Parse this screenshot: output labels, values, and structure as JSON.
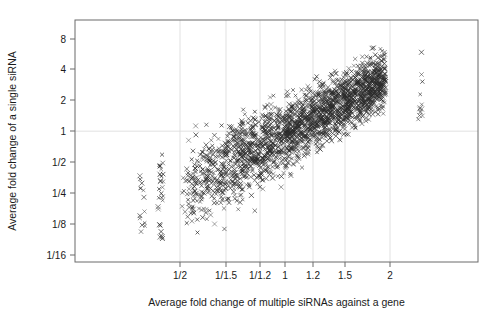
{
  "chart_data": {
    "type": "scatter",
    "title": "",
    "xlabel": "Average fold change of multiple siRNAs against a gene",
    "ylabel": "Average fold change of a single siRNA",
    "marker": "x-cross",
    "grid": "vertical gridlines at x ticks, horizontal gridline at y = 1",
    "legend": "none",
    "x_axis": {
      "scale": "log",
      "tick_labels": [
        "1/2",
        "1/1.5",
        "1/1.2",
        "1",
        "1.2",
        "1.5",
        "2"
      ],
      "tick_values": [
        0.5,
        0.6667,
        0.8333,
        1.0,
        1.2,
        1.5,
        2.0
      ],
      "tick_pixels": [
        180,
        226,
        260,
        285,
        313,
        345,
        390
      ],
      "xlim": [
        0.36,
        2.6
      ]
    },
    "y_axis": {
      "scale": "log",
      "tick_labels": [
        "8",
        "4",
        "2",
        "1",
        "1/2",
        "1/4",
        "1/8",
        "1/16"
      ],
      "tick_values": [
        8,
        4,
        2,
        1,
        0.5,
        0.25,
        0.125,
        0.0625
      ],
      "tick_pixels": [
        39,
        69,
        100,
        131,
        162,
        193,
        224,
        255
      ],
      "ylim": [
        0.05,
        11.5
      ]
    },
    "plot_area_px": {
      "left": 75,
      "right": 478,
      "top": 20,
      "bottom": 262
    },
    "point_count_approx": 2400,
    "clusters": [
      {
        "name": "left-sparse-column-1",
        "x_center": 0.385,
        "y_range": [
          0.1,
          0.45
        ],
        "n": 14
      },
      {
        "name": "left-sparse-column-2",
        "x_center": 0.435,
        "y_range": [
          0.09,
          0.62
        ],
        "n": 30
      },
      {
        "name": "main-cloud",
        "x_range": [
          0.5,
          1.95
        ],
        "y_range": [
          0.1,
          6.5
        ],
        "n": 2300
      },
      {
        "name": "right-isolated-column",
        "x_center": 2.45,
        "y_range": [
          1.3,
          7.0
        ],
        "n": 12
      }
    ]
  }
}
